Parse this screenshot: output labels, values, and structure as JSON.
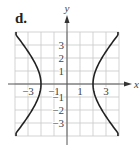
{
  "panel": {
    "label": "d."
  },
  "chart_data": {
    "type": "line",
    "title": "d.",
    "xlabel": "x",
    "ylabel": "y",
    "xlim": [
      -4,
      4
    ],
    "ylim": [
      -4,
      4
    ],
    "grid": true,
    "x_tick_labels": [
      "-3",
      "-1",
      "1",
      "3"
    ],
    "x_ticks": [
      -3,
      -1,
      1,
      3
    ],
    "y_tick_labels": [
      "3",
      "2",
      "1",
      "-1",
      "-2",
      "-3"
    ],
    "y_ticks": [
      3,
      2,
      1,
      -1,
      -2,
      -3
    ],
    "series": [
      {
        "name": "right branch",
        "equation": "x^2/4 - y^2/5 = 1",
        "vertex": [
          2,
          0
        ],
        "points": [
          [
            3.85,
            4
          ],
          [
            3.0,
            2.5
          ],
          [
            2.5,
            1.68
          ],
          [
            2.0,
            0
          ],
          [
            2.5,
            -1.68
          ],
          [
            3.0,
            -2.5
          ],
          [
            3.85,
            -4
          ]
        ]
      },
      {
        "name": "left branch",
        "equation": "x^2/4 - y^2/5 = 1",
        "vertex": [
          -2,
          0
        ],
        "points": [
          [
            -3.85,
            4
          ],
          [
            -3.0,
            2.5
          ],
          [
            -2.5,
            1.68
          ],
          [
            -2.0,
            0
          ],
          [
            -2.5,
            -1.68
          ],
          [
            -3.0,
            -2.5
          ],
          [
            -3.85,
            -4
          ]
        ]
      }
    ],
    "colors": {
      "curve": "#222222",
      "grid": "#c8c8c8",
      "axis": "#555555"
    }
  }
}
